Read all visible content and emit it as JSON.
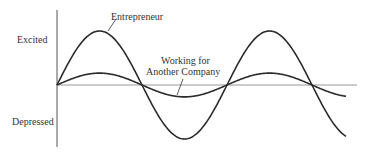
{
  "chart_data": {
    "type": "line",
    "title": "",
    "xlabel": "",
    "ylabel": "",
    "y_tick_labels": [
      "Excited",
      "Depressed"
    ],
    "grid": false,
    "legend": "inline annotations",
    "x": [
      0,
      0.25,
      0.5,
      0.75,
      1.0,
      1.25,
      1.5,
      1.75,
      2.0
    ],
    "series": [
      {
        "name": "Entrepreneur",
        "values": [
          0,
          1,
          0,
          -1,
          0,
          1,
          0,
          -1,
          -0.9
        ],
        "amplitude": 1.0
      },
      {
        "name": "Working for Another Company",
        "values": [
          0,
          0.22,
          0,
          -0.22,
          0,
          0.22,
          0,
          -0.22,
          -0.2
        ],
        "amplitude": 0.22
      }
    ],
    "annotations": [
      "Entrepreneur",
      "Working for Another Company"
    ]
  },
  "labels": {
    "excited": "Excited",
    "depressed": "Depressed",
    "entrepreneur": "Entrepreneur",
    "working_line1": "Working for",
    "working_line2": "Another Company"
  },
  "colors": {
    "line": "#2b2b2b",
    "axis": "#888888",
    "text": "#333333"
  }
}
